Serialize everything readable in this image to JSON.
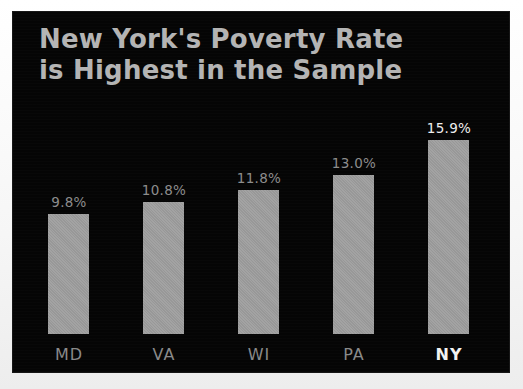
{
  "chart_data": {
    "type": "bar",
    "title": "New York's Poverty Rate is Highest in the Sample",
    "title_lines": [
      "New York's Poverty Rate",
      "is Highest in the Sample"
    ],
    "categories": [
      "MD",
      "VA",
      "WI",
      "PA",
      "NY"
    ],
    "values": [
      9.8,
      10.8,
      11.8,
      13.0,
      15.9
    ],
    "value_labels": [
      "9.8%",
      "10.8%",
      "11.8%",
      "13.0%",
      "15.9%"
    ],
    "highlight_category": "NY",
    "xlabel": "",
    "ylabel": "",
    "ylim": [
      0,
      17.6
    ],
    "grid": false,
    "legend": "none",
    "colors": {
      "background": "#050505",
      "bar_fill": "#9e9e9e",
      "title_text": "#b4b4b4",
      "label_text": "#8a8a8a",
      "highlight_text": "#f2f2f2"
    }
  },
  "bars": [
    {
      "category": "MD",
      "value": 9.8,
      "value_label": "9.8%",
      "highlight": false
    },
    {
      "category": "VA",
      "value": 10.8,
      "value_label": "10.8%",
      "highlight": false
    },
    {
      "category": "WI",
      "value": 11.8,
      "value_label": "11.8%",
      "highlight": false
    },
    {
      "category": "PA",
      "value": 13.0,
      "value_label": "13.0%",
      "highlight": false
    },
    {
      "category": "NY",
      "value": 15.9,
      "value_label": "15.9%",
      "highlight": true
    }
  ]
}
